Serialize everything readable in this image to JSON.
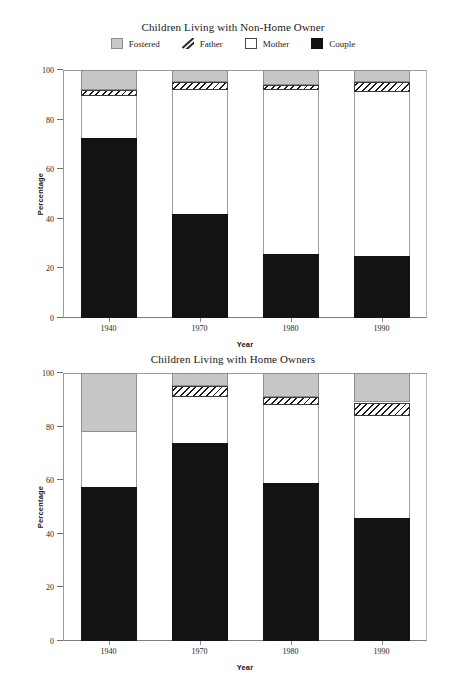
{
  "legend": {
    "items": [
      {
        "label": "Fostered",
        "icon": "fostered-swatch-icon",
        "color": "#c6c6c6"
      },
      {
        "label": "Father",
        "icon": "father-swatch-icon",
        "color": "#ffffff"
      },
      {
        "label": "Mother",
        "icon": "mother-swatch-icon",
        "color": "#ffffff"
      },
      {
        "label": "Couple",
        "icon": "couple-swatch-icon",
        "color": "#131313"
      }
    ]
  },
  "axis": {
    "y_title": "Percentage",
    "x_title": "Year",
    "y_ticks": [
      0,
      20,
      40,
      60,
      80,
      100
    ]
  },
  "chart_data": [
    {
      "type": "bar",
      "stacked": true,
      "title": "Children Living with Non-Home Owner",
      "xlabel": "Year",
      "ylabel": "Percentage",
      "ylim": [
        0,
        100
      ],
      "yticks": [
        0,
        20,
        40,
        60,
        80,
        100
      ],
      "grid": false,
      "legend_position": "top-center",
      "categories": [
        "1940",
        "1970",
        "1980",
        "1990"
      ],
      "series": [
        {
          "name": "Couple",
          "values": [
            72.5,
            42.0,
            26.0,
            25.0
          ]
        },
        {
          "name": "Mother",
          "values": [
            17.0,
            50.0,
            66.0,
            66.0
          ]
        },
        {
          "name": "Father",
          "values": [
            2.5,
            3.0,
            2.0,
            4.0
          ]
        },
        {
          "name": "Fostered",
          "values": [
            8.0,
            5.0,
            6.0,
            5.0
          ]
        }
      ]
    },
    {
      "type": "bar",
      "stacked": true,
      "title": "Children Living with Home Owners",
      "xlabel": "Year",
      "ylabel": "Percentage",
      "ylim": [
        0,
        100
      ],
      "yticks": [
        0,
        20,
        40,
        60,
        80,
        100
      ],
      "grid": false,
      "legend_position": "none",
      "categories": [
        "1940",
        "1970",
        "1980",
        "1990"
      ],
      "series": [
        {
          "name": "Couple",
          "values": [
            57.5,
            74.0,
            59.0,
            46.0
          ]
        },
        {
          "name": "Mother",
          "values": [
            20.5,
            17.0,
            29.0,
            38.0
          ]
        },
        {
          "name": "Father",
          "values": [
            0.0,
            4.0,
            3.0,
            5.0
          ]
        },
        {
          "name": "Fostered",
          "values": [
            22.0,
            5.0,
            9.0,
            11.0
          ]
        }
      ]
    }
  ]
}
